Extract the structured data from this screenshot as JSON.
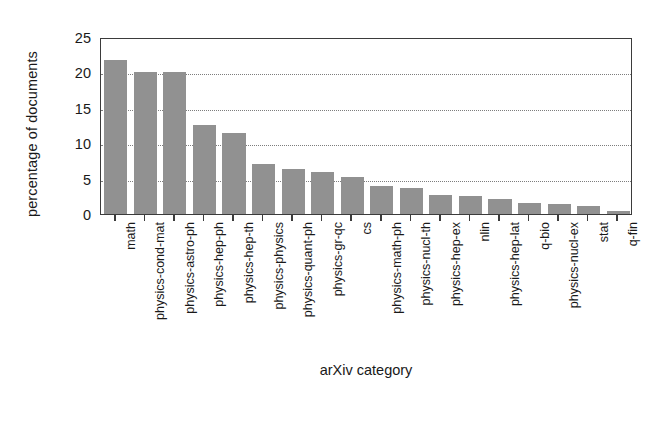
{
  "chart_data": {
    "type": "bar",
    "title": "",
    "xlabel": "arXiv category",
    "ylabel": "percentage of documents",
    "categories": [
      "math",
      "physics-cond-mat",
      "physics-astro-ph",
      "physics-hep-ph",
      "physics-hep-th",
      "physics-physics",
      "physics-quant-ph",
      "physics-gr-qc",
      "cs",
      "physics-math-ph",
      "physics-nucl-th",
      "physics-hep-ex",
      "nlin",
      "physics-hep-lat",
      "q-bio",
      "physics-nucl-ex",
      "stat",
      "q-fin"
    ],
    "values": [
      21.7,
      20.0,
      20.0,
      12.6,
      11.4,
      7.1,
      6.3,
      6.0,
      5.2,
      3.9,
      3.7,
      2.7,
      2.6,
      2.1,
      1.5,
      1.4,
      1.2,
      0.4
    ],
    "ylim": [
      0,
      25
    ],
    "yticks": [
      0,
      5,
      10,
      15,
      20,
      25
    ],
    "ytick_labels": [
      "0",
      "5",
      "10",
      "15",
      "20",
      "25"
    ],
    "gridlines": [
      5,
      10,
      15,
      20
    ],
    "grid": true,
    "grid_style": "dotted-horizontal",
    "legend": null,
    "bar_color": "#919191",
    "axis_color": "#3b3b3b",
    "grid_color": "#7d7d7d",
    "background_color": "#ffffff"
  }
}
